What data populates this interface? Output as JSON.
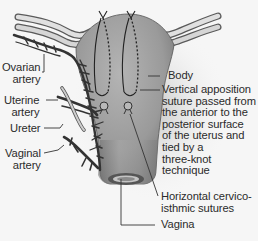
{
  "diagram": {
    "type": "anatomical illustration",
    "colors": {
      "background": "#f6f6f6",
      "uterus_fill": "#9c9c9c",
      "uterus_shadow": "#7a7a7a",
      "vessel_dark": "#3a3a3a",
      "tube_light": "#d8d8d8",
      "suture": "#2a2a2a",
      "text": "#2b2b2b"
    },
    "labels": {
      "ovarian_artery": "Ovarian\nartery",
      "uterine_artery": "Uterine\nartery",
      "ureter": "Ureter",
      "vaginal_artery": "Vaginal\nartery",
      "body": "Body",
      "vertical_suture": "Vertical apposition\nsuture passed from\nthe anterior to the\nposterior surface\nof the uterus and\ntied by a\nthree-knot\ntechnique",
      "horizontal_sutures": "Horizontal cervico-\nisthmic sutures",
      "vagina": "Vagina"
    }
  }
}
